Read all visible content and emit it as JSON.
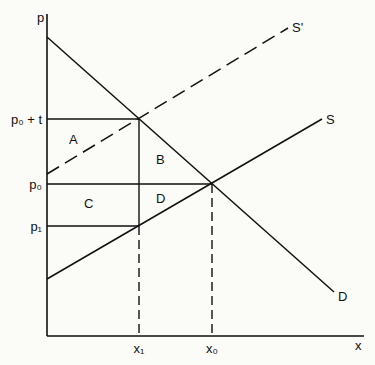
{
  "axes": {
    "y_label": "p",
    "x_label": "x"
  },
  "price_ticks": {
    "p0_plus_t": "p₀ + t",
    "p0": "p₀",
    "p1": "p₁"
  },
  "quantity_ticks": {
    "x1": "x₁",
    "x0": "x₀"
  },
  "curves": {
    "supply_taxed": "S'",
    "supply": "S",
    "demand": "D"
  },
  "regions": {
    "a": "A",
    "b": "B",
    "c": "C",
    "d": "D"
  },
  "colors": {
    "ink": "#111111",
    "background": "#fbfbf7"
  }
}
